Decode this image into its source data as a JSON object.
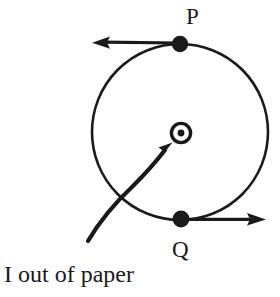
{
  "figure": {
    "background_color": "#ffffff",
    "stroke_color": "#1a1a1a",
    "width": 280,
    "height": 297
  },
  "labels": {
    "point_p": "P",
    "point_q": "Q",
    "caption": "I out of paper"
  },
  "icons": {
    "current_out_of_page": "circle-dot-icon",
    "field_vector_p": "left-arrow-icon",
    "field_vector_q": "right-arrow-icon",
    "current_pointer": "curved-arrow-icon"
  },
  "geometry": {
    "field_circle": {
      "cx": 180,
      "cy": 132,
      "r": 88,
      "stroke_width": 2.6
    },
    "point_p_dot": {
      "cx": 180,
      "cy": 44,
      "r": 8
    },
    "point_q_dot": {
      "cx": 181,
      "cy": 219,
      "r": 8
    },
    "current_symbol": {
      "cx": 181,
      "cy": 133,
      "outer_r": 10,
      "ring_width": 3.2,
      "inner_r": 3.4
    },
    "arrow_p": {
      "x1": 180,
      "y1": 43,
      "x2": 95,
      "y2": 42,
      "direction": "left"
    },
    "arrow_q": {
      "x1": 181,
      "y1": 219,
      "x2": 264,
      "y2": 219,
      "direction": "right"
    },
    "curved_pointer": {
      "tip_x": 172,
      "tip_y": 143,
      "tail_x": 88,
      "tail_y": 241
    }
  }
}
